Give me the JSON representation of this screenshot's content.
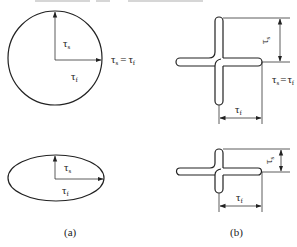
{
  "diagram": {
    "stroke_color": "#222222",
    "background": "#ffffff",
    "panel_a": {
      "caption": "(a)",
      "circle": {
        "label_vertical": "τ",
        "label_vertical_sub": "s",
        "label_horizontal": "τ",
        "label_horizontal_sub": "f",
        "equality_label": "τs = τf",
        "eq_left": "τ",
        "eq_left_sub": "s",
        "eq_sign": "=",
        "eq_right": "τ",
        "eq_right_sub": "f"
      },
      "ellipse": {
        "label_vertical": "τ",
        "label_vertical_sub": "s",
        "label_horizontal": "τ",
        "label_horizontal_sub": "f"
      }
    },
    "panel_b": {
      "caption": "(b)",
      "cross_top": {
        "vertical_dim_label": "τ",
        "vertical_dim_sub": "s",
        "horizontal_dim_label": "τ",
        "horizontal_dim_sub": "f",
        "eq_left": "τ",
        "eq_left_sub": "s",
        "eq_sign": "=",
        "eq_right": "τ",
        "eq_right_sub": "f"
      },
      "cross_bottom": {
        "vertical_dim_label": "τ",
        "vertical_dim_sub": "s",
        "horizontal_dim_label": "τ",
        "horizontal_dim_sub": "f"
      }
    }
  }
}
